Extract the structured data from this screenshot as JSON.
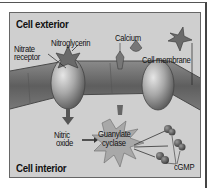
{
  "figure": {
    "regions": {
      "exterior_label": "Cell exterior",
      "interior_label": "Cell interior"
    },
    "labels": {
      "nitrate_receptor": [
        "Nitrate",
        "receptor"
      ],
      "nitroglycerin": "Nitroglycerin",
      "calcium": "Calcium",
      "cell_membrane": "Cell membrane",
      "nitric_oxide": [
        "Nitric",
        "oxide"
      ],
      "guanylate_cyclase": [
        "Guanylate",
        "cyclase"
      ],
      "cgmp": "cGMP"
    },
    "colors": {
      "panel_background": "#cfcfcf",
      "membrane": "#6e6e6e",
      "protein": "#9a9a9a",
      "text": "#111111"
    }
  }
}
